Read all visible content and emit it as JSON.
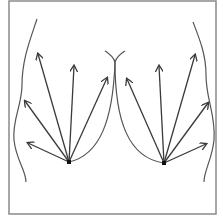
{
  "diagram": {
    "title": "",
    "frame": {
      "x": 9,
      "y": 1,
      "width": 207,
      "height": 213,
      "stroke": "#8a8a8a"
    },
    "colors": {
      "line": "#555555",
      "arrow": "#3a3a3a",
      "background": "#ffffff"
    },
    "left_group": {
      "origin": {
        "x": 69,
        "y": 162
      },
      "arrow_tips": [
        {
          "x": 28,
          "y": 143
        },
        {
          "x": 25,
          "y": 101
        },
        {
          "x": 38,
          "y": 54
        },
        {
          "x": 74,
          "y": 66
        },
        {
          "x": 107,
          "y": 78
        }
      ]
    },
    "right_group": {
      "origin": {
        "x": 164,
        "y": 163
      },
      "arrow_tips": [
        {
          "x": 127,
          "y": 79
        },
        {
          "x": 159,
          "y": 66
        },
        {
          "x": 195,
          "y": 55
        },
        {
          "x": 208,
          "y": 103
        },
        {
          "x": 206,
          "y": 144
        }
      ]
    },
    "curves": {
      "left_body_outline": "M 37 19 C 30 40, 22 60, 22 85 C 22 105, 12 120, 14 140 C 16 160, 26 170, 26 182",
      "right_body_outline": "M 193 22 C 200 40, 206 55, 206 75 C 206 100, 216 115, 214 140 C 212 160, 204 170, 204 182",
      "left_breast_curve": "M 115 62 C 113 120, 100 155, 69 162",
      "right_breast_curve": "M 115 62 C 115 120, 128 158, 164 163",
      "cleavage_left_fork": "M 115 62 C 113 56, 108 53, 105 51",
      "cleavage_right_fork": "M 115 62 C 117 56, 122 53, 125 51"
    }
  }
}
